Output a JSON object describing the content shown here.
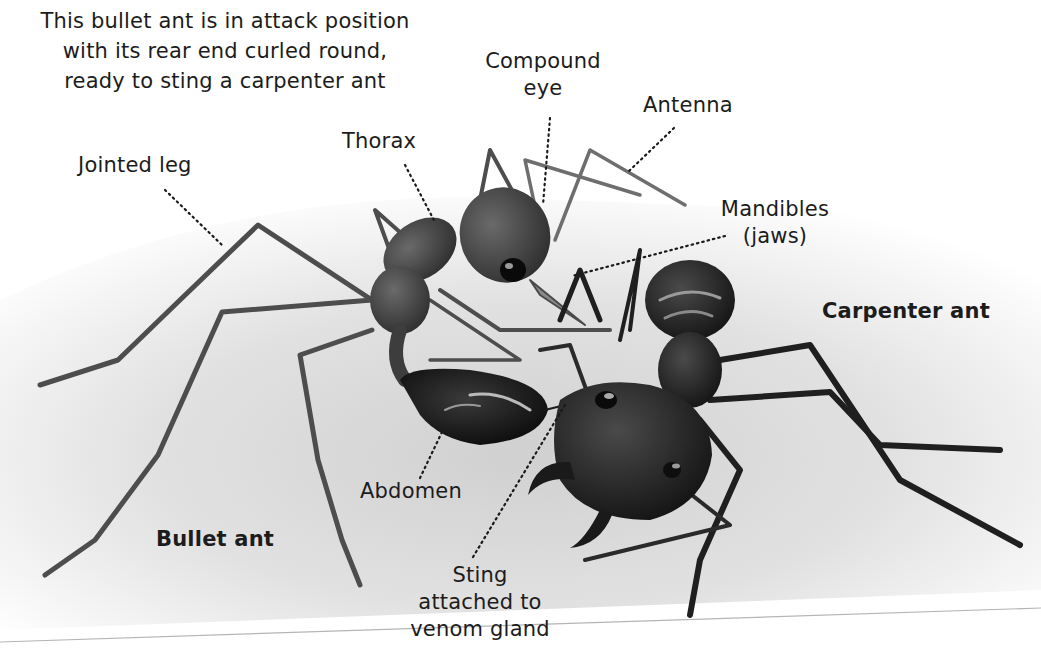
{
  "caption": {
    "lines": [
      "This bullet ant is in attack position",
      "with its rear end curled round,",
      "ready to sting a carpenter ant"
    ]
  },
  "labels": {
    "jointed_leg": "Jointed leg",
    "thorax": "Thorax",
    "compound_eye": [
      "Compound",
      "eye"
    ],
    "antenna": "Antenna",
    "mandibles": [
      "Mandibles",
      "(jaws)"
    ],
    "abdomen": "Abdomen",
    "sting": [
      "Sting",
      "attached to",
      "venom gland"
    ]
  },
  "species": {
    "bullet_ant": "Bullet ant",
    "carpenter_ant": "Carpenter ant"
  },
  "colors": {
    "background": "#ffffff",
    "ground": "#d9d9d9",
    "ant_body": "#2b2b2b",
    "bullet_ant_body": "#4a4a4a",
    "leader_line": "#1a1a1a",
    "text": "#1c1c1c"
  }
}
